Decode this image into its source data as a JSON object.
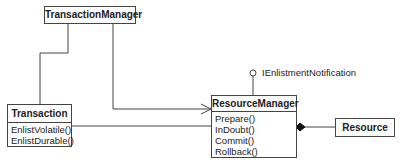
{
  "diagram": {
    "type": "UML class diagram",
    "classes": [
      {
        "id": "transaction_manager",
        "name": "TransactionManager",
        "operations": []
      },
      {
        "id": "transaction",
        "name": "Transaction",
        "operations": [
          "EnlistVolatile()",
          "EnlistDurable()"
        ]
      },
      {
        "id": "resource_manager",
        "name": "ResourceManager",
        "operations": [
          "Prepare()",
          "InDoubt()",
          "Commit()",
          "Rollback()"
        ]
      },
      {
        "id": "resource",
        "name": "Resource",
        "operations": []
      }
    ],
    "interface": {
      "name": "IEnlistmentNotification",
      "implemented_by": "ResourceManager"
    },
    "relationships": [
      {
        "from": "TransactionManager",
        "to": "Transaction",
        "type": "association"
      },
      {
        "from": "TransactionManager",
        "to": "ResourceManager",
        "type": "directed-association"
      },
      {
        "from": "Transaction",
        "to": "ResourceManager",
        "type": "association"
      },
      {
        "from": "ResourceManager",
        "to": "Resource",
        "type": "composition"
      }
    ],
    "colors": {
      "line": "#444444",
      "text": "#222222",
      "background": "#ffffff"
    }
  }
}
